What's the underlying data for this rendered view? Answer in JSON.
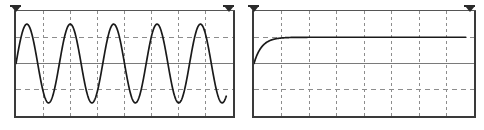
{
  "panels": [
    {
      "name": "sine-waveform-panel",
      "chart_data": {
        "type": "line",
        "title": "",
        "xlabel": "",
        "ylabel": "",
        "grid": true,
        "grid_columns": 8,
        "grid_rows": 4,
        "xlim": [
          0,
          8
        ],
        "ylim": [
          -2,
          2
        ],
        "waveform": "sine",
        "cycles": 5,
        "amplitude_divisions": 1.5,
        "offset_divisions": 0,
        "trace_start_x": 0,
        "trace_end_x": 7.75,
        "legend": null,
        "annotations": []
      },
      "markers": [
        "trigger-marker-left",
        "trigger-marker-right"
      ]
    },
    {
      "name": "step-response-panel",
      "chart_data": {
        "type": "line",
        "title": "",
        "xlabel": "",
        "ylabel": "",
        "grid": true,
        "grid_columns": 8,
        "grid_rows": 4,
        "xlim": [
          0,
          8
        ],
        "ylim": [
          -2,
          2
        ],
        "waveform": "exponential-step",
        "initial_value_divisions": 0,
        "final_value_divisions": 1.0,
        "time_constant_divisions": 0.28,
        "trace_start_x": 0,
        "trace_end_x": 7.7,
        "legend": null,
        "annotations": []
      },
      "markers": [
        "trigger-marker-left",
        "trigger-marker-right"
      ]
    }
  ],
  "colors": {
    "background": "#ffffff",
    "frame": "#3a3a3a",
    "grid_dash": "#8d8d8d",
    "center_line": "#7a7a7a",
    "trace": "#1a1a1a",
    "marker": "#2b2b2b"
  }
}
